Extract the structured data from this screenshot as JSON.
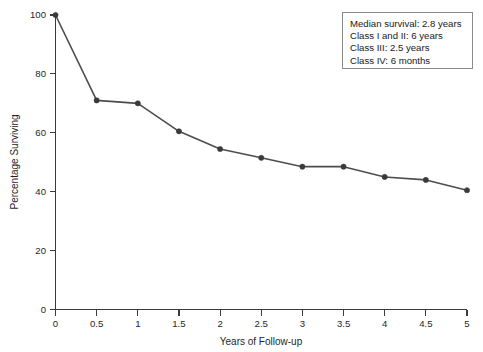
{
  "chart_data": {
    "type": "line",
    "title": "",
    "xlabel": "Years of Follow-up",
    "ylabel": "Percentage Surviving",
    "xlim": [
      0,
      5
    ],
    "ylim": [
      0,
      100
    ],
    "grid": false,
    "legend_position": "top-right",
    "x": [
      0,
      0.5,
      1,
      1.5,
      2,
      2.5,
      3,
      3.5,
      4,
      4.5,
      5
    ],
    "values": [
      100,
      71,
      70,
      60.5,
      54.5,
      51.5,
      48.5,
      48.5,
      45,
      44,
      40.5
    ],
    "xticks": [
      "0",
      "0.5",
      "1",
      "1.5",
      "2",
      "2.5",
      "3",
      "3.5",
      "4",
      "4.5",
      "5"
    ],
    "xtick_values": [
      0,
      0.5,
      1,
      1.5,
      2,
      2.5,
      3,
      3.5,
      4,
      4.5,
      5
    ],
    "yticks": [
      "0",
      "20",
      "40",
      "60",
      "80",
      "100"
    ],
    "ytick_values": [
      0,
      20,
      40,
      60,
      80,
      100
    ],
    "series": [
      {
        "name": "Survival",
        "values": [
          100,
          71,
          70,
          60.5,
          54.5,
          51.5,
          48.5,
          48.5,
          45,
          44,
          40.5
        ],
        "color": "#4d4d4d",
        "marker": "circle"
      }
    ],
    "annotations": [
      "Median survival: 2.8 years",
      "Class I and II: 6 years",
      "Class III: 2.5 years",
      "Class IV: 6 months"
    ]
  },
  "colors": {
    "line": "#4d4d4d",
    "marker": "#3a3a3a",
    "axis": "#3b3b3b",
    "text": "#1a1a1a",
    "legend_border": "#8a8a8a",
    "background": "#ffffff"
  }
}
